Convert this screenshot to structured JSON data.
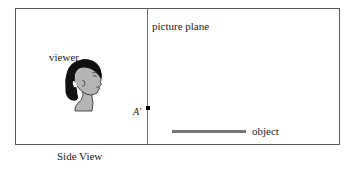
{
  "figure": {
    "caption": "Side View",
    "labels": {
      "picture_plane": "picture plane",
      "viewer": "viewer",
      "object": "object",
      "projected_point": "A′"
    },
    "elements": {
      "frame": "rectangle-border",
      "picture_plane_line": "vertical-line",
      "point_marker": "black-square-dot",
      "object_line": "horizontal-gray-segment",
      "viewer_head": "head-profile-facing-right"
    },
    "colors": {
      "frame_border": "#5a5a5a",
      "picture_plane_line": "#6e6e6e",
      "object_line": "#767676",
      "point_marker": "#000000",
      "hair": "#111111",
      "skin": "#b5b5b5",
      "outline": "#2b2b2b",
      "background": "#ffffff",
      "text": "#1a1a1a"
    }
  }
}
